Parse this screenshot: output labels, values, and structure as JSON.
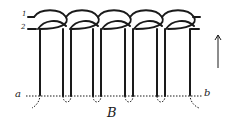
{
  "figure": {
    "labels": {
      "strand_1": "1",
      "strand_2": "2",
      "point_a": "a",
      "point_b": "b",
      "figure_label": "B"
    },
    "loops": 5,
    "cord_pairs": 4,
    "direction": "up",
    "colors": {
      "ink": "#1a1a1a",
      "background": "#ffffff"
    }
  }
}
